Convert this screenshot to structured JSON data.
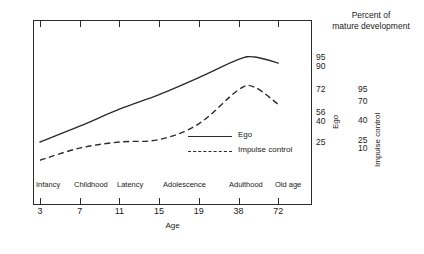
{
  "chart_data": {
    "type": "line",
    "title": "Percent of mature development",
    "title_line1": "Percent of",
    "title_line2": "mature development",
    "xlabel": "Age",
    "ylabel": "Percent of mature development",
    "grid": false,
    "legend_position": "inside-center-right",
    "x_tick_labels": [
      "3",
      "7",
      "11",
      "15",
      "19",
      "38",
      "72"
    ],
    "x_tick_values": [
      3,
      7,
      11,
      15,
      19,
      38,
      72
    ],
    "stage_labels": [
      "Infancy",
      "Childhood",
      "Latency",
      "Adolescence",
      "Adulthood",
      "Old age"
    ],
    "right_axes": [
      {
        "name": "Ego",
        "label": "Ego",
        "tick_labels": [
          "95",
          "90",
          "72",
          "56",
          "40",
          "25"
        ],
        "tick_values": [
          95,
          90,
          72,
          56,
          40,
          25
        ]
      },
      {
        "name": "Impulse control",
        "label": "Impulse control",
        "tick_labels": [
          "95",
          "70",
          "40",
          "25",
          "10"
        ],
        "tick_values": [
          95,
          70,
          40,
          25,
          10
        ]
      }
    ],
    "series": [
      {
        "name": "Ego",
        "style": "solid",
        "color": "#2b2b2b",
        "x": [
          3,
          7,
          11,
          15,
          19,
          38,
          52,
          72
        ],
        "values": [
          25,
          38,
          52,
          64,
          78,
          93,
          95,
          90
        ]
      },
      {
        "name": "Impulse control",
        "style": "dashed",
        "color": "#2b2b2b",
        "x": [
          3,
          7,
          11,
          15,
          19,
          38,
          52,
          72
        ],
        "values": [
          10,
          20,
          25,
          27,
          40,
          68,
          70,
          56
        ]
      }
    ],
    "legend": [
      {
        "label": "Ego",
        "style": "solid"
      },
      {
        "label": "Impulse control",
        "style": "dashed"
      }
    ]
  },
  "axis_titles": {
    "x": "Age",
    "ego": "Ego",
    "impulse": "Impulse control"
  }
}
